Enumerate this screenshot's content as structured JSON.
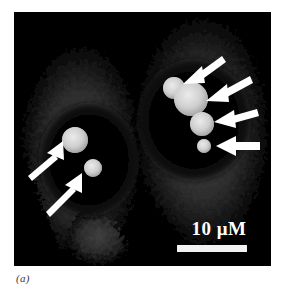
{
  "figure": {
    "caption": "(a)",
    "panel_background": "#000000",
    "page_background": "#ffffff"
  },
  "scale_bar": {
    "label": "10 μM",
    "value": "10",
    "unit": "μM",
    "bar_color": "#f2f2f2"
  },
  "micrograph": {
    "modality": "fluorescence-confocal-micrograph",
    "cell_count": 2,
    "cytoplasm_color": "#9a9a9a",
    "nucleus_color": "#050505",
    "droplet_color": "#d9d9d9",
    "arrow_color": "#ffffff",
    "cells": [
      {
        "name": "left-cell",
        "nucleus": {
          "cx": 75,
          "cy": 148,
          "rx": 49,
          "ry": 56
        },
        "droplets": [
          {
            "name": "droplet-left-1",
            "cx": 61,
            "cy": 128,
            "r": 13
          },
          {
            "name": "droplet-left-2",
            "cx": 79,
            "cy": 156,
            "r": 9
          }
        ],
        "arrows": [
          {
            "name": "arrow-left-1",
            "x1": 16,
            "y1": 160,
            "x2": 46,
            "y2": 133
          },
          {
            "name": "arrow-left-2",
            "x1": 34,
            "y1": 196,
            "x2": 65,
            "y2": 165
          }
        ]
      },
      {
        "name": "right-cell",
        "nucleus": {
          "cx": 180,
          "cy": 108,
          "rx": 56,
          "ry": 60
        },
        "droplets": [
          {
            "name": "droplet-right-1",
            "cx": 160,
            "cy": 76,
            "r": 11
          },
          {
            "name": "droplet-right-2",
            "cx": 177,
            "cy": 87,
            "r": 17
          },
          {
            "name": "droplet-right-3",
            "cx": 188,
            "cy": 112,
            "r": 12
          },
          {
            "name": "droplet-right-4",
            "cx": 190,
            "cy": 134,
            "r": 7
          }
        ],
        "arrows": [
          {
            "name": "arrow-right-1",
            "x1": 205,
            "y1": 47,
            "x2": 171,
            "y2": 71
          },
          {
            "name": "arrow-right-2",
            "x1": 232,
            "y1": 68,
            "x2": 193,
            "y2": 88
          },
          {
            "name": "arrow-right-3",
            "x1": 240,
            "y1": 101,
            "x2": 201,
            "y2": 110
          },
          {
            "name": "arrow-right-4",
            "x1": 243,
            "y1": 134,
            "x2": 203,
            "y2": 134
          }
        ]
      }
    ]
  }
}
